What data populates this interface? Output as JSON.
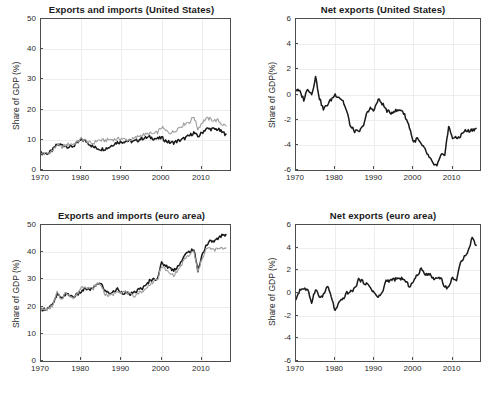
{
  "figure": {
    "width": 497,
    "height": 410,
    "background": "#ffffff",
    "layout": "2x2 subplot grid"
  },
  "colors": {
    "series_dark": "#1a1a1a",
    "series_light": "#9e9e9e",
    "axis": "#4d4d4d",
    "grid": "#ededed",
    "text": "#2b2b2b"
  },
  "chart_data": [
    {
      "id": "exports-imports-united-states",
      "type": "line",
      "title": "Exports and imports (United States)",
      "xlabel": "",
      "ylabel": "Share of GDP (%)",
      "xlim": [
        1970,
        2017
      ],
      "ylim": [
        0,
        50
      ],
      "xticks": [
        1970,
        1980,
        1990,
        2000,
        2010
      ],
      "yticks": [
        0,
        10,
        20,
        30,
        40,
        50
      ],
      "grid": true,
      "legend": "none",
      "x": [
        1970,
        1971,
        1972,
        1973,
        1974,
        1975,
        1976,
        1977,
        1978,
        1979,
        1980,
        1981,
        1982,
        1983,
        1984,
        1985,
        1986,
        1987,
        1988,
        1989,
        1990,
        1991,
        1992,
        1993,
        1994,
        1995,
        1996,
        1997,
        1998,
        1999,
        2000,
        2001,
        2002,
        2003,
        2004,
        2005,
        2006,
        2007,
        2008,
        2009,
        2010,
        2011,
        2012,
        2013,
        2014,
        2015,
        2016
      ],
      "series": [
        {
          "name": "Exports",
          "color": "#1a1a1a",
          "values": [
            5.6,
            5.5,
            5.6,
            6.8,
            8.4,
            8.3,
            8.1,
            7.6,
            7.9,
            8.8,
            10.0,
            9.7,
            8.7,
            7.6,
            7.2,
            6.9,
            7.1,
            7.6,
            8.6,
            9.2,
            9.3,
            9.6,
            9.6,
            9.4,
            9.8,
            10.5,
            10.6,
            10.9,
            10.5,
            10.3,
            10.7,
            9.7,
            9.1,
            9.1,
            9.6,
            10.0,
            10.7,
            11.4,
            12.4,
            11.0,
            12.3,
            13.6,
            13.6,
            13.5,
            13.5,
            12.5,
            11.9
          ]
        },
        {
          "name": "Imports",
          "color": "#9e9e9e",
          "values": [
            5.3,
            5.4,
            5.7,
            6.5,
            8.4,
            7.5,
            8.1,
            8.6,
            8.6,
            9.3,
            10.3,
            9.8,
            9.0,
            8.8,
            9.8,
            9.8,
            9.8,
            10.1,
            10.1,
            10.2,
            10.5,
            10.0,
            10.0,
            10.3,
            11.0,
            11.6,
            11.7,
            12.1,
            11.9,
            12.5,
            14.2,
            13.0,
            12.4,
            12.6,
            13.8,
            14.6,
            15.6,
            15.9,
            17.8,
            13.6,
            15.6,
            17.0,
            16.9,
            16.4,
            16.4,
            15.2,
            14.6
          ]
        }
      ]
    },
    {
      "id": "net-exports-united-states",
      "type": "line",
      "title": "Net exports (United States)",
      "xlabel": "",
      "ylabel": "Share of GDP(%)",
      "xlim": [
        1970,
        2017
      ],
      "ylim": [
        -6,
        6
      ],
      "xticks": [
        1970,
        1980,
        1990,
        2000,
        2010
      ],
      "yticks": [
        -6,
        -4,
        -2,
        0,
        2,
        4,
        6
      ],
      "grid": true,
      "legend": "none",
      "x": [
        1970,
        1971,
        1972,
        1973,
        1974,
        1975,
        1976,
        1977,
        1978,
        1979,
        1980,
        1981,
        1982,
        1983,
        1984,
        1985,
        1986,
        1987,
        1988,
        1989,
        1990,
        1991,
        1992,
        1993,
        1994,
        1995,
        1996,
        1997,
        1998,
        1999,
        2000,
        2001,
        2002,
        2003,
        2004,
        2005,
        2006,
        2007,
        2008,
        2009,
        2010,
        2011,
        2012,
        2013,
        2014,
        2015,
        2016
      ],
      "series": [
        {
          "name": "Net exports",
          "color": "#1a1a1a",
          "values": [
            0.4,
            0.2,
            -0.4,
            0.5,
            0.0,
            1.4,
            -0.3,
            -1.2,
            -0.8,
            -0.4,
            0.0,
            -0.2,
            -0.5,
            -1.4,
            -2.6,
            -2.9,
            -3.0,
            -2.6,
            -1.6,
            -1.1,
            -1.2,
            -0.4,
            -0.7,
            -1.2,
            -1.5,
            -1.3,
            -1.3,
            -1.2,
            -1.8,
            -2.6,
            -3.8,
            -3.5,
            -4.0,
            -4.4,
            -5.0,
            -5.5,
            -5.7,
            -4.9,
            -4.7,
            -2.6,
            -3.4,
            -3.5,
            -3.3,
            -2.9,
            -2.9,
            -2.8,
            -2.7
          ]
        }
      ]
    },
    {
      "id": "exports-imports-euro-area",
      "type": "line",
      "title": "Exports and imports (euro area)",
      "xlabel": "",
      "ylabel": "Share of GDP (%)",
      "xlim": [
        1970,
        2017
      ],
      "ylim": [
        0,
        50
      ],
      "xticks": [
        1970,
        1980,
        1990,
        2000,
        2010
      ],
      "yticks": [
        0,
        10,
        20,
        30,
        40,
        50
      ],
      "grid": true,
      "legend": "none",
      "x": [
        1970,
        1971,
        1972,
        1973,
        1974,
        1975,
        1976,
        1977,
        1978,
        1979,
        1980,
        1981,
        1982,
        1983,
        1984,
        1985,
        1986,
        1987,
        1988,
        1989,
        1990,
        1991,
        1992,
        1993,
        1994,
        1995,
        1996,
        1997,
        1998,
        1999,
        2000,
        2001,
        2002,
        2003,
        2004,
        2005,
        2006,
        2007,
        2008,
        2009,
        2010,
        2011,
        2012,
        2013,
        2014,
        2015,
        2016
      ],
      "series": [
        {
          "name": "Exports",
          "color": "#1a1a1a",
          "values": [
            19.0,
            19.1,
            19.6,
            20.8,
            24.5,
            23.0,
            24.5,
            24.3,
            23.6,
            24.4,
            25.5,
            26.6,
            26.3,
            26.6,
            28.6,
            28.2,
            25.6,
            25.0,
            25.3,
            26.5,
            25.3,
            25.0,
            24.6,
            24.8,
            26.0,
            26.8,
            27.4,
            29.6,
            30.0,
            30.6,
            36.0,
            35.1,
            34.2,
            33.3,
            34.9,
            36.8,
            39.3,
            40.4,
            41.0,
            33.2,
            38.7,
            42.3,
            44.0,
            44.1,
            44.9,
            46.3,
            46.5
          ]
        },
        {
          "name": "Imports",
          "color": "#9e9e9e",
          "values": [
            19.0,
            18.8,
            19.2,
            20.6,
            25.3,
            22.6,
            24.9,
            24.5,
            23.0,
            24.7,
            27.1,
            27.5,
            26.8,
            26.6,
            28.5,
            27.8,
            24.4,
            24.0,
            24.5,
            26.0,
            25.3,
            25.4,
            24.6,
            23.7,
            24.9,
            25.6,
            26.2,
            28.3,
            29.0,
            30.0,
            35.0,
            33.5,
            32.1,
            31.6,
            33.2,
            35.5,
            38.0,
            39.0,
            40.5,
            32.7,
            37.3,
            41.2,
            41.4,
            40.8,
            41.2,
            41.4,
            41.5
          ]
        }
      ]
    },
    {
      "id": "net-exports-euro-area",
      "type": "line",
      "title": "Net exports (euro area)",
      "xlabel": "",
      "ylabel": "Share of GDP (%)",
      "xlim": [
        1970,
        2017
      ],
      "ylim": [
        -6,
        6
      ],
      "xticks": [
        1970,
        1980,
        1990,
        2000,
        2010
      ],
      "yticks": [
        -6,
        -4,
        -2,
        0,
        2,
        4,
        6
      ],
      "grid": true,
      "legend": "none",
      "x": [
        1970,
        1971,
        1972,
        1973,
        1974,
        1975,
        1976,
        1977,
        1978,
        1979,
        1980,
        1981,
        1982,
        1983,
        1984,
        1985,
        1986,
        1987,
        1988,
        1989,
        1990,
        1991,
        1992,
        1993,
        1994,
        1995,
        1996,
        1997,
        1998,
        1999,
        2000,
        2001,
        2002,
        2003,
        2004,
        2005,
        2006,
        2007,
        2008,
        2009,
        2010,
        2011,
        2012,
        2013,
        2014,
        2015,
        2016
      ],
      "series": [
        {
          "name": "Net exports",
          "color": "#1a1a1a",
          "values": [
            -0.5,
            0.3,
            0.4,
            0.2,
            -0.8,
            0.4,
            -0.4,
            -0.2,
            0.6,
            -0.3,
            -1.6,
            -0.9,
            -0.5,
            0.0,
            0.1,
            0.4,
            1.2,
            1.0,
            0.8,
            0.5,
            0.0,
            -0.4,
            0.0,
            1.1,
            1.1,
            1.2,
            1.2,
            1.3,
            1.0,
            0.6,
            1.0,
            1.6,
            2.1,
            1.7,
            1.7,
            1.3,
            1.3,
            1.4,
            0.5,
            0.5,
            1.4,
            1.1,
            2.6,
            3.3,
            3.7,
            4.9,
            4.2
          ]
        }
      ]
    }
  ],
  "panels": [
    {
      "title": "Exports and imports (United States)",
      "ylabel": "Share of GDP (%)",
      "ytick_labels": [
        "50",
        "40",
        "30",
        "20",
        "10",
        "0"
      ],
      "xtick_labels": [
        "1970",
        "1980",
        "1990",
        "2000",
        "2010"
      ]
    },
    {
      "title": "Net exports (United States)",
      "ylabel": "Share of GDP(%)",
      "ytick_labels": [
        "6",
        "4",
        "2",
        "0",
        "-2",
        "-4",
        "-6"
      ],
      "xtick_labels": [
        "1970",
        "1980",
        "1990",
        "2000",
        "2010"
      ]
    },
    {
      "title": "Exports and imports (euro area)",
      "ylabel": "Share of GDP (%)",
      "ytick_labels": [
        "50",
        "40",
        "30",
        "20",
        "10",
        "0"
      ],
      "xtick_labels": [
        "1970",
        "1980",
        "1990",
        "2000",
        "2010"
      ]
    },
    {
      "title": "Net exports (euro area)",
      "ylabel": "Share of GDP (%)",
      "ytick_labels": [
        "6",
        "4",
        "2",
        "0",
        "-2",
        "-4",
        "-6"
      ],
      "xtick_labels": [
        "1970",
        "1980",
        "1990",
        "2000",
        "2010"
      ]
    }
  ]
}
